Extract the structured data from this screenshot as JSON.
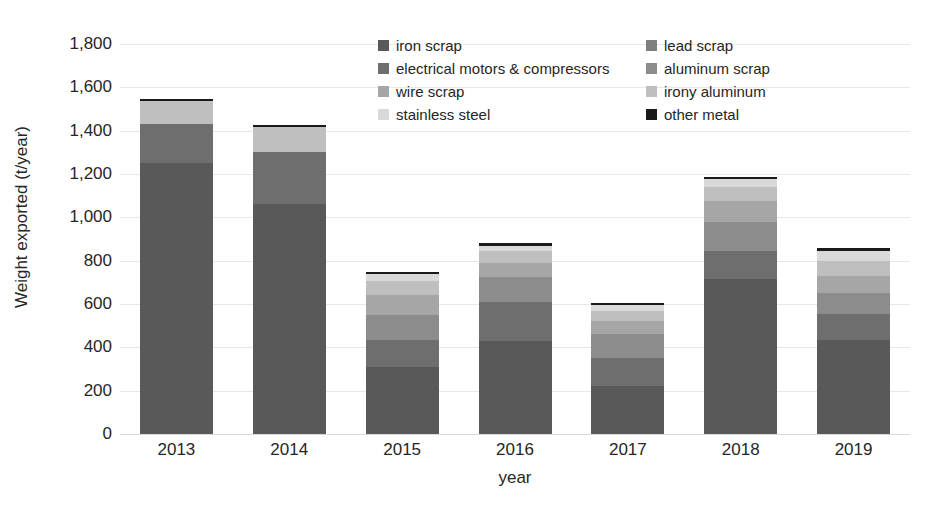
{
  "chart_data": {
    "type": "bar",
    "stacked": true,
    "title": "",
    "xlabel": "year",
    "ylabel": "Weight exported (t/year)",
    "categories": [
      "2013",
      "2014",
      "2015",
      "2016",
      "2017",
      "2018",
      "2019"
    ],
    "ylim": [
      0,
      1800
    ],
    "yticks": [
      0,
      200,
      400,
      600,
      800,
      1000,
      1200,
      1400,
      1600,
      1800
    ],
    "ytick_labels": [
      "0",
      "200",
      "400",
      "600",
      "800",
      "1,000",
      "1,200",
      "1,400",
      "1,600",
      "1,800"
    ],
    "grid": true,
    "grid_axis": "y",
    "legend_position": "top-center",
    "legend_columns": 2,
    "series": [
      {
        "name": "iron scrap",
        "color": "#595959",
        "values": [
          1250,
          1060,
          310,
          430,
          220,
          715,
          435
        ]
      },
      {
        "name": "lead scrap",
        "color": "#7f7f7f",
        "values": [
          0,
          0,
          0,
          0,
          0,
          0,
          0
        ]
      },
      {
        "name": "electrical motors & compressors",
        "color": "#6e6e6e",
        "values": [
          180,
          240,
          125,
          180,
          130,
          130,
          120
        ]
      },
      {
        "name": "aluminum scrap",
        "color": "#8c8c8c",
        "values": [
          0,
          0,
          115,
          115,
          110,
          135,
          95
        ]
      },
      {
        "name": "wire scrap",
        "color": "#a6a6a6",
        "values": [
          0,
          0,
          90,
          65,
          60,
          95,
          80
        ]
      },
      {
        "name": "irony aluminum",
        "color": "#bfbfbf",
        "values": [
          105,
          115,
          65,
          55,
          50,
          65,
          70
        ]
      },
      {
        "name": "stainless steel",
        "color": "#d9d9d9",
        "values": [
          0,
          0,
          35,
          25,
          25,
          35,
          45
        ]
      },
      {
        "name": "other metal",
        "color": "#1a1a1a",
        "values": [
          10,
          12,
          10,
          10,
          10,
          12,
          14
        ]
      }
    ],
    "totals": [
      1545,
      1427,
      750,
      880,
      605,
      1187,
      859
    ]
  },
  "axes": {
    "y_title": "Weight exported (t/year)",
    "x_title": "year"
  },
  "legend": {
    "items": [
      {
        "label": "iron scrap",
        "color": "#595959"
      },
      {
        "label": "lead scrap",
        "color": "#7f7f7f"
      },
      {
        "label": "electrical motors & compressors",
        "color": "#6e6e6e"
      },
      {
        "label": "aluminum scrap",
        "color": "#8c8c8c"
      },
      {
        "label": "wire scrap",
        "color": "#a6a6a6"
      },
      {
        "label": "irony aluminum",
        "color": "#bfbfbf"
      },
      {
        "label": "stainless steel",
        "color": "#d9d9d9"
      },
      {
        "label": "other metal",
        "color": "#1a1a1a"
      }
    ]
  }
}
